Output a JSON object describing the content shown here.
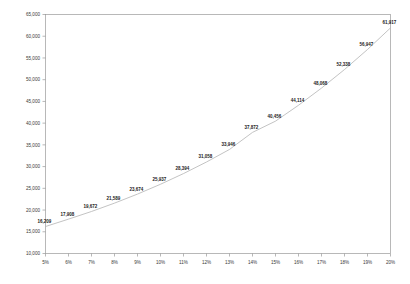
{
  "chart_data": {
    "type": "line",
    "title": "",
    "subtitle": "",
    "xlabel": "",
    "ylabel": "",
    "grid": false,
    "legend": "none",
    "categories": [
      "5%",
      "6%",
      "7%",
      "8%",
      "9%",
      "10%",
      "11%",
      "12%",
      "13%",
      "14%",
      "15%",
      "16%",
      "17%",
      "18%",
      "19%",
      "20%"
    ],
    "x": [
      5,
      6,
      7,
      8,
      9,
      10,
      11,
      12,
      13,
      14,
      15,
      16,
      17,
      18,
      19,
      20
    ],
    "values": [
      16209,
      17908,
      19672,
      21589,
      23674,
      25937,
      28394,
      31058,
      33946,
      37872,
      40456,
      44114,
      48068,
      52338,
      56947,
      61917
    ],
    "point_labels": [
      "16,209",
      "17,908",
      "19,672",
      "21,589",
      "23,674",
      "25,937",
      "28,394",
      "31,058",
      "33,946",
      "37,872",
      "40,456",
      "44,114",
      "48,068",
      "52,338",
      "56,947",
      "61,917"
    ],
    "xlim": [
      5,
      20
    ],
    "ylim": [
      10000,
      65000
    ],
    "ytick_values": [
      10000,
      15000,
      20000,
      25000,
      30000,
      35000,
      40000,
      45000,
      50000,
      55000,
      60000,
      65000
    ],
    "ytick_labels": [
      "10,000",
      "15,000",
      "20,000",
      "25,000",
      "30,000",
      "35,000",
      "40,000",
      "45,000",
      "50,000",
      "55,000",
      "60,000",
      "65,000"
    ],
    "xtick_labels": [
      "5%",
      "6%",
      "7%",
      "8%",
      "9%",
      "10%",
      "11%",
      "12%",
      "13%",
      "14%",
      "15%",
      "16%",
      "17%",
      "18%",
      "19%",
      "20%"
    ],
    "colors": {
      "background": "#ffffff",
      "axis": "#9a9a9a",
      "curve": "#b4b4b4",
      "tick_text": "#3a3a3a",
      "label_text": "#1a1a1a"
    }
  }
}
